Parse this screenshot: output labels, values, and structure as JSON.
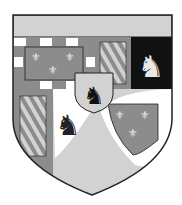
{
  "image": {
    "subject": "coat-of-arms",
    "style": "grayscale",
    "colors": {
      "light": "#d2d2d2",
      "mid": "#8c8c8c",
      "dark": "#111111",
      "white": "#ffffff",
      "outline": "#222222"
    },
    "charges": [
      "fleur-de-lis",
      "lion-rampant",
      "bendy",
      "bordure-compony",
      "inescutcheon"
    ]
  }
}
